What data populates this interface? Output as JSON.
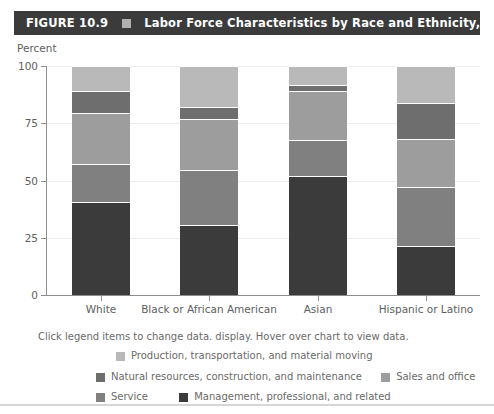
{
  "header": {
    "figure_number": "FIGURE 10.9",
    "square_icon": "square-icon",
    "title": "Labor Force Characteristics by Race and Ethnicity, 2017"
  },
  "hint": "Click legend items to change data. display. Hover over chart to view data.",
  "colors": {
    "header_bg": "#3b3b3b",
    "production": "#b9b9b9",
    "natural_resources": "#6e6e6e",
    "sales_office": "#9d9d9d",
    "service": "#808080",
    "management": "#3b3b3b",
    "gridline": "#ededed",
    "axis": "#8e8e8e",
    "text": "#5e5e5e"
  },
  "legend": [
    {
      "label": "Production, transportation, and material moving",
      "color": "#b9b9b9",
      "key": "production"
    },
    {
      "label": "Natural resources, construction, and maintenance",
      "color": "#6e6e6e",
      "key": "natural_resources"
    },
    {
      "label": "Sales and office",
      "color": "#9d9d9d",
      "key": "sales_office"
    },
    {
      "label": "Service",
      "color": "#808080",
      "key": "service"
    },
    {
      "label": "Management, professional, and related",
      "color": "#3b3b3b",
      "key": "management"
    }
  ],
  "chart_data": {
    "type": "bar",
    "stacked": true,
    "title": "Labor Force Characteristics by Race and Ethnicity, 2017",
    "xlabel": "",
    "ylabel": "Percent",
    "ylim": [
      0,
      100
    ],
    "yticks": [
      0,
      25,
      50,
      75,
      100
    ],
    "grid": true,
    "legend_position": "bottom",
    "categories": [
      "White",
      "Black or African American",
      "Asian",
      "Hispanic or Latino"
    ],
    "series": [
      {
        "name": "Management, professional, and related",
        "color": "#3b3b3b",
        "values": [
          40.5,
          30.5,
          52.0,
          21.5
        ]
      },
      {
        "name": "Service",
        "color": "#808080",
        "values": [
          16.5,
          24.0,
          15.5,
          25.5
        ]
      },
      {
        "name": "Sales and office",
        "color": "#9d9d9d",
        "values": [
          22.5,
          22.5,
          21.5,
          21.0
        ]
      },
      {
        "name": "Natural resources, construction, and maintenance",
        "color": "#6e6e6e",
        "values": [
          9.5,
          5.0,
          2.5,
          16.0
        ]
      },
      {
        "name": "Production, transportation, and material moving",
        "color": "#b9b9b9",
        "values": [
          11.0,
          18.0,
          8.5,
          16.0
        ]
      }
    ]
  }
}
